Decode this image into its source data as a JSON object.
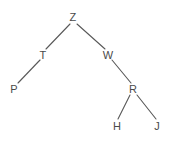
{
  "diagram": {
    "type": "tree-graph",
    "title": "",
    "background_color": "#ffffff",
    "node_color": "#4a4a4a",
    "edge_color": "#585858",
    "width": 190,
    "height": 147,
    "nodes": [
      {
        "id": "Z",
        "label": "Z",
        "x": 73,
        "y": 17
      },
      {
        "id": "T",
        "label": "T",
        "x": 43,
        "y": 55
      },
      {
        "id": "W",
        "label": "W",
        "x": 108,
        "y": 55
      },
      {
        "id": "P",
        "label": "P",
        "x": 14,
        "y": 89
      },
      {
        "id": "R",
        "label": "R",
        "x": 133,
        "y": 89
      },
      {
        "id": "H",
        "label": "H",
        "x": 117,
        "y": 126
      },
      {
        "id": "J",
        "label": "J",
        "x": 157,
        "y": 126
      }
    ],
    "edges": [
      {
        "from": "Z",
        "to": "T",
        "x1": 70,
        "y1": 24,
        "x2": 46,
        "y2": 49
      },
      {
        "from": "Z",
        "to": "W",
        "x1": 77,
        "y1": 24,
        "x2": 105,
        "y2": 49
      },
      {
        "from": "T",
        "to": "P",
        "x1": 40,
        "y1": 60,
        "x2": 18,
        "y2": 83
      },
      {
        "from": "W",
        "to": "R",
        "x1": 112,
        "y1": 60,
        "x2": 131,
        "y2": 83
      },
      {
        "from": "R",
        "to": "H",
        "x1": 130,
        "y1": 95,
        "x2": 118,
        "y2": 119
      },
      {
        "from": "R",
        "to": "J",
        "x1": 137,
        "y1": 95,
        "x2": 156,
        "y2": 119
      }
    ]
  }
}
